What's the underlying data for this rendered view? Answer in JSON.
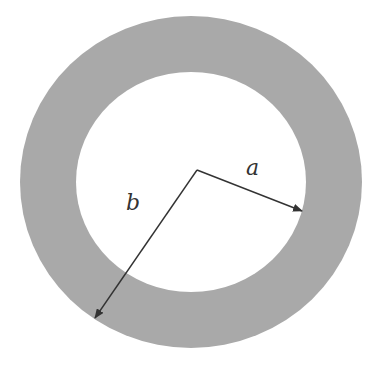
{
  "diagram": {
    "title": "",
    "shape": "annulus",
    "colors": {
      "ring_fill": "#a9a9a9",
      "inner_fill": "#ffffff",
      "arrow": "#333333",
      "label": "#333333"
    },
    "outer_circle": {
      "cx": 191,
      "cy": 182,
      "rx": 171,
      "ry": 166
    },
    "inner_circle": {
      "cx": 191,
      "cy": 182,
      "rx": 115,
      "ry": 110
    },
    "center_point": {
      "x": 197,
      "y": 170
    },
    "radii": [
      {
        "label": "a",
        "from": [
          197,
          170
        ],
        "to": [
          302,
          211
        ],
        "label_pos": [
          252,
          175
        ]
      },
      {
        "label": "b",
        "from": [
          197,
          170
        ],
        "to": [
          95,
          318
        ],
        "label_pos": [
          132,
          210
        ]
      }
    ]
  }
}
